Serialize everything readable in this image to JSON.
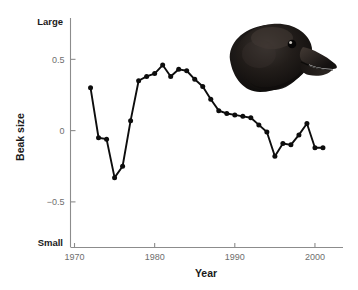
{
  "figure": {
    "photo": {
      "name": "darwins-finch-head-photo",
      "description": "Darwin's finch head in right profile",
      "plumage_color": "#15120f",
      "beak_color": "#2c2622",
      "eye_color": "#0a0a0a",
      "eye_highlight": "#e8e4de"
    },
    "background_color": "#ffffff",
    "line_color": "#0d0d0d",
    "axis_color": "#8c8c8c",
    "tick_text_color": "#6e6e6e",
    "label_text_color": "#1a1a1a"
  },
  "chart_data": {
    "type": "line",
    "title": "",
    "xlabel": "Year",
    "ylabel": "Beak size",
    "xlim": [
      1969.5,
      2003.5
    ],
    "ylim": [
      -0.82,
      0.79
    ],
    "xticks": [
      1970,
      1980,
      1990,
      2000
    ],
    "xtick_labels": [
      "1970",
      "1980",
      "1990",
      "2000"
    ],
    "yticks": [
      -0.5,
      0,
      0.5
    ],
    "ytick_labels": [
      "−0.5",
      "0",
      "0.5"
    ],
    "y_axis_extreme_labels": {
      "top": "Large",
      "bottom": "Small"
    },
    "grid": false,
    "legend": false,
    "marker": "filled-circle",
    "series": [
      {
        "name": "Beak size",
        "x": [
          1972,
          1973,
          1974,
          1975,
          1976,
          1977,
          1978,
          1979,
          1980,
          1981,
          1982,
          1983,
          1984,
          1985,
          1986,
          1987,
          1988,
          1989,
          1990,
          1991,
          1992,
          1993,
          1994,
          1995,
          1996,
          1997,
          1998,
          1999,
          2000,
          2001
        ],
        "values": [
          0.3,
          -0.05,
          -0.06,
          -0.33,
          -0.25,
          0.07,
          0.35,
          0.38,
          0.4,
          0.46,
          0.38,
          0.43,
          0.42,
          0.36,
          0.31,
          0.22,
          0.14,
          0.12,
          0.11,
          0.1,
          0.09,
          0.04,
          -0.01,
          -0.18,
          -0.09,
          -0.1,
          -0.03,
          0.05,
          -0.12,
          -0.12
        ]
      }
    ]
  }
}
